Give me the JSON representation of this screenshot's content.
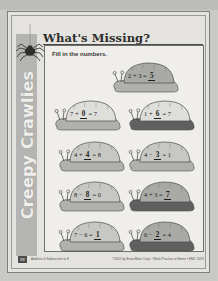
{
  "page": {
    "title": "What's Missing?",
    "instruction": "Fill in the numbers.",
    "side_banner": "Creepy Crawlies",
    "page_number": "88"
  },
  "footer": {
    "left_text": "Addition & Subtraction to 8",
    "right_text": "©2001 by Evan-Moor Corp. • Math Practice at Home • EMC 3019"
  },
  "colors": {
    "sheet": "#e4e3df",
    "content_box": "#efeeea",
    "banner": "#b4b4b2",
    "ink": "#1d1d1b",
    "shell_dark": "#a9a9a5",
    "shell_light": "#dededa",
    "shell_mid": "#c7c7c3",
    "body_dark": "#606060",
    "body_light": "#b0b0ac"
  },
  "problems": [
    {
      "id": "p1",
      "row": 1,
      "column": "right",
      "left_operand": "2",
      "operator": "+",
      "right_operand": "3",
      "equals": "=",
      "answer": "5",
      "blank_position": "result",
      "expression": "2 + 3 = 5",
      "shell_tone": "dark",
      "body_tone": "light"
    },
    {
      "id": "p2",
      "row": 2,
      "column": "left",
      "left_operand": "7",
      "operator": "+",
      "right_operand": "0",
      "equals": "=",
      "answer": "7",
      "blank_position": "second-operand",
      "expression": "7 + 0 = 7",
      "shell_tone": "light",
      "body_tone": "light"
    },
    {
      "id": "p3",
      "row": 2,
      "column": "right",
      "left_operand": "1",
      "operator": "+",
      "right_operand": "6",
      "equals": "=",
      "answer": "7",
      "blank_position": "second-operand",
      "expression": "1 + 6 = 7",
      "shell_tone": "light",
      "body_tone": "dark"
    },
    {
      "id": "p4",
      "row": 3,
      "column": "left",
      "left_operand": "4",
      "operator": "+",
      "right_operand": "4",
      "equals": "=",
      "answer": "8",
      "blank_position": "second-operand",
      "expression": "4 + 4 = 8",
      "shell_tone": "mid",
      "body_tone": "light"
    },
    {
      "id": "p5",
      "row": 3,
      "column": "right",
      "left_operand": "4",
      "operator": "−",
      "right_operand": "3",
      "equals": "=",
      "answer": "1",
      "blank_position": "second-operand",
      "expression": "4 − 3 = 1",
      "shell_tone": "mid",
      "body_tone": "light"
    },
    {
      "id": "p6",
      "row": 4,
      "column": "left",
      "left_operand": "8",
      "operator": "−",
      "right_operand": "8",
      "equals": "=",
      "answer": "0",
      "blank_position": "second-operand",
      "expression": "8 − 8 = 0",
      "shell_tone": "mid",
      "body_tone": "light"
    },
    {
      "id": "p7",
      "row": 4,
      "column": "right",
      "left_operand": "4",
      "operator": "+",
      "right_operand": "3",
      "equals": "=",
      "answer": "7",
      "blank_position": "result",
      "expression": "4 + 3 = 7",
      "shell_tone": "dark",
      "body_tone": "dark"
    },
    {
      "id": "p8",
      "row": 5,
      "column": "left",
      "left_operand": "7",
      "operator": "−",
      "right_operand": "6",
      "equals": "=",
      "answer": "1",
      "blank_position": "result",
      "expression": "7 − 6 = 1",
      "shell_tone": "mid",
      "body_tone": "light"
    },
    {
      "id": "p9",
      "row": 5,
      "column": "right",
      "left_operand": "6",
      "operator": "−",
      "right_operand": "2",
      "equals": "=",
      "answer": "4",
      "blank_position": "second-operand",
      "expression": "6 − 2 = 4",
      "shell_tone": "dark",
      "body_tone": "dark"
    }
  ]
}
